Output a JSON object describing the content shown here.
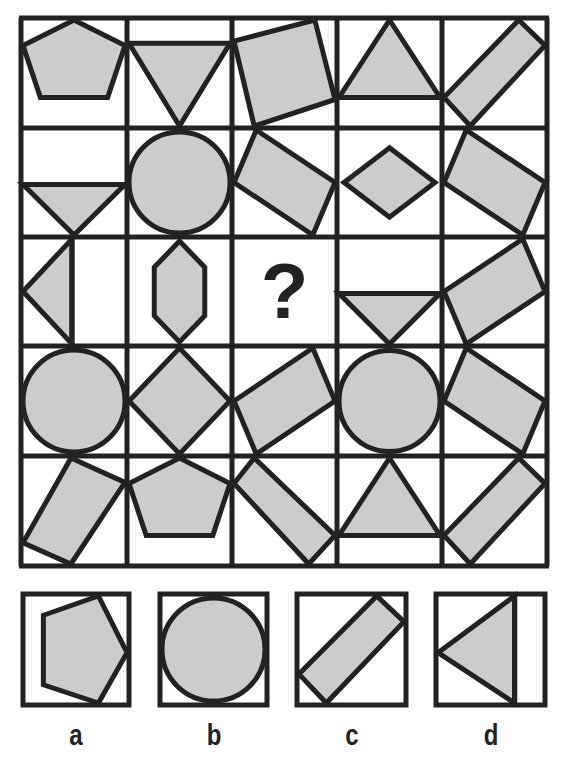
{
  "puzzle": {
    "style": {
      "fill": "#cccccc",
      "stroke": "#222222",
      "background": "#ffffff"
    },
    "grid": {
      "left": 21,
      "top": 18,
      "right": 547,
      "bottom": 566,
      "cols": [
        21,
        127,
        232,
        337,
        442,
        547
      ],
      "rows": [
        18,
        128,
        237,
        346,
        456,
        566
      ],
      "question_mark": "?",
      "cells": [
        {
          "r": 0,
          "c": 0,
          "shape": "pentagon",
          "desc": "upright pentagon"
        },
        {
          "r": 0,
          "c": 1,
          "shape": "triangle-down",
          "desc": "inverted triangle"
        },
        {
          "r": 0,
          "c": 2,
          "shape": "rotated-square",
          "desc": "tilted square"
        },
        {
          "r": 0,
          "c": 3,
          "shape": "triangle-up",
          "desc": "upright triangle"
        },
        {
          "r": 0,
          "c": 4,
          "shape": "diagonal-bar",
          "desc": "bar rising to right"
        },
        {
          "r": 1,
          "c": 0,
          "shape": "small-triangle-down",
          "desc": "small inverted triangle low"
        },
        {
          "r": 1,
          "c": 1,
          "shape": "circle",
          "desc": "circle"
        },
        {
          "r": 1,
          "c": 2,
          "shape": "rotated-rect",
          "desc": "tilted rectangle"
        },
        {
          "r": 1,
          "c": 3,
          "shape": "diamond",
          "desc": "small diamond"
        },
        {
          "r": 1,
          "c": 4,
          "shape": "rotated-rect",
          "desc": "tilted rectangle"
        },
        {
          "r": 2,
          "c": 0,
          "shape": "triangle-left",
          "desc": "half triangle pointing left"
        },
        {
          "r": 2,
          "c": 1,
          "shape": "hexagon",
          "desc": "vertical hexagon"
        },
        {
          "r": 2,
          "c": 2,
          "shape": "question",
          "desc": "question mark"
        },
        {
          "r": 2,
          "c": 3,
          "shape": "small-triangle-down",
          "desc": "small inverted triangle low"
        },
        {
          "r": 2,
          "c": 4,
          "shape": "rotated-rect",
          "desc": "tilted rectangle"
        },
        {
          "r": 3,
          "c": 0,
          "shape": "circle",
          "desc": "circle"
        },
        {
          "r": 3,
          "c": 1,
          "shape": "diamond-large",
          "desc": "large diamond"
        },
        {
          "r": 3,
          "c": 2,
          "shape": "rotated-rect",
          "desc": "tilted rectangle"
        },
        {
          "r": 3,
          "c": 3,
          "shape": "circle",
          "desc": "circle"
        },
        {
          "r": 3,
          "c": 4,
          "shape": "rotated-rect",
          "desc": "tilted rectangle"
        },
        {
          "r": 4,
          "c": 0,
          "shape": "rotated-rect",
          "desc": "tilted rectangle"
        },
        {
          "r": 4,
          "c": 1,
          "shape": "pentagon",
          "desc": "upright pentagon"
        },
        {
          "r": 4,
          "c": 2,
          "shape": "diagonal-bar-down",
          "desc": "bar falling to right"
        },
        {
          "r": 4,
          "c": 3,
          "shape": "triangle-up",
          "desc": "upright triangle"
        },
        {
          "r": 4,
          "c": 4,
          "shape": "diagonal-bar",
          "desc": "bar rising to right"
        }
      ]
    },
    "options": [
      {
        "label": "a",
        "shape": "pentagon-right",
        "box": [
          23,
          594,
          129,
          705
        ],
        "label_x": 58,
        "label_y": 718
      },
      {
        "label": "b",
        "shape": "circle",
        "box": [
          160,
          594,
          267,
          705
        ],
        "label_x": 195,
        "label_y": 718
      },
      {
        "label": "c",
        "shape": "diagonal-bar",
        "box": [
          297,
          594,
          406,
          705
        ],
        "label_x": 332,
        "label_y": 718
      },
      {
        "label": "d",
        "shape": "triangle-left-partial",
        "box": [
          436,
          594,
          545,
          705
        ],
        "label_x": 470,
        "label_y": 718
      }
    ]
  }
}
